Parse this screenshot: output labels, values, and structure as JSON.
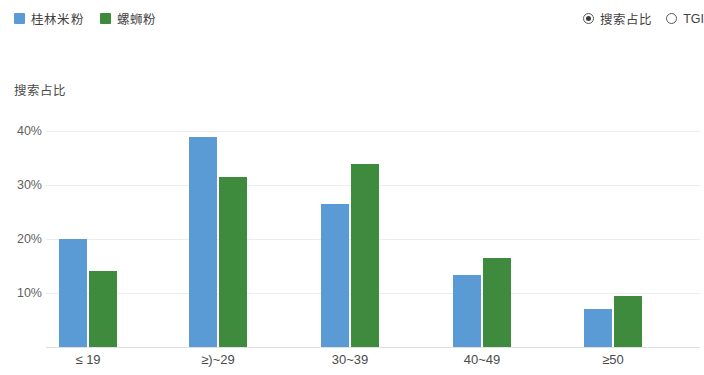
{
  "legend": {
    "items": [
      {
        "label": "桂林米粉",
        "color": "#5B9BD5",
        "icon": "legend-swatch-icon"
      },
      {
        "label": "螺蛳粉",
        "color": "#3E8B3D",
        "icon": "legend-swatch-icon"
      }
    ]
  },
  "radio_group": {
    "items": [
      {
        "label": "搜索占比",
        "selected": true
      },
      {
        "label": "TGI",
        "selected": false
      }
    ]
  },
  "axis_title": "搜索占比",
  "chart_data": {
    "type": "bar",
    "title": "",
    "subtitle": "",
    "xlabel": "",
    "ylabel": "搜索占比",
    "categories": [
      "≤ 19",
      "≥)~29",
      "30~39",
      "40~49",
      "≥50"
    ],
    "series": [
      {
        "name": "桂林米粉",
        "color": "#5B9BD5",
        "values": [
          20.0,
          38.8,
          26.5,
          13.3,
          7.0
        ]
      },
      {
        "name": "螺蛳粉",
        "color": "#3E8B3D",
        "values": [
          14.1,
          31.5,
          33.8,
          16.5,
          9.4
        ]
      }
    ],
    "ylim": [
      0,
      43.5
    ],
    "yticks": [
      10,
      20,
      30,
      40
    ],
    "ytick_labels": [
      "10%",
      "20%",
      "30%",
      "40%"
    ],
    "grid": true,
    "legend_position": "top-left",
    "value_format": "percent"
  }
}
